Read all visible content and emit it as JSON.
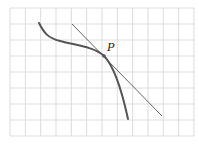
{
  "diagram": {
    "grid": {
      "x0": 10,
      "y0": 8,
      "cols": 12,
      "rows": 8,
      "cell_w": 15.33,
      "cell_h": 16,
      "color": "#d4d4d4"
    },
    "curve": {
      "color": "#555555",
      "path": "M39,23 C44,33 48,38 60,41 C75,45 95,47 104,56 C112,64 120,82 128,119"
    },
    "tangent": {
      "color": "#555555",
      "x1": 72,
      "y1": 24,
      "x2": 162,
      "y2": 116
    },
    "point": {
      "label": "P",
      "x": 104,
      "y": 56,
      "label_x": 107,
      "label_y": 51
    }
  }
}
